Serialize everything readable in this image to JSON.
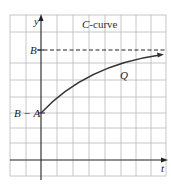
{
  "diagram": {
    "title_italic": "C",
    "title_rest": "-curve",
    "axis_labels": {
      "y": "y",
      "x": "t"
    },
    "levels": [
      {
        "label": "B",
        "description": "asymptote (dashed)"
      },
      {
        "label": "B − A",
        "description": "initial value"
      }
    ],
    "curve_label": "Q",
    "colors": {
      "grid": "#b8b8b8",
      "axis": "#222222",
      "curve": "#333333"
    }
  }
}
